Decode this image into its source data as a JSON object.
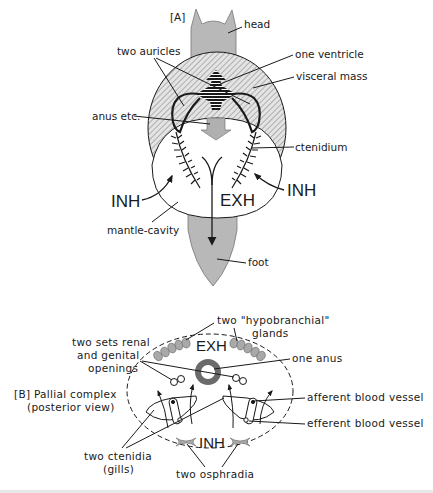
{
  "figure": {
    "panel_a": {
      "tag": "[A]",
      "labels": {
        "head": "head",
        "two_auricles": "two auricles",
        "one_ventricle": "one ventricle",
        "visceral_mass": "visceral mass",
        "anus": "anus etc.",
        "ctenidium": "ctenidium",
        "inh_left": "INH",
        "inh_right": "INH",
        "exh": "EXH",
        "mantle_cavity": "mantle-cavity",
        "foot": "foot"
      }
    },
    "panel_b": {
      "title_line1": "[B] Pallial complex",
      "title_line2": "(posterior view)",
      "labels": {
        "hypobranchial_line1": "two \"hypobranchial\"",
        "hypobranchial_line2": "glands",
        "renal_line1": "two sets renal",
        "renal_line2": "and genital",
        "renal_line3": "openings",
        "exh": "EXH",
        "one_anus": "one anus",
        "afferent": "afferent blood vessel",
        "efferent": "efferent blood vessel",
        "ctenidia_line1": "two ctenidia",
        "ctenidia_line2": "(gills)",
        "inh": "INH",
        "osphradia": "two osphradia"
      }
    },
    "colors": {
      "body_grey": "#b8b8b8",
      "hatch": "#8a8a8a",
      "ink": "#1a1a1a",
      "anus_ring": "#6a6a6a",
      "gland": "#a9a9a9"
    }
  }
}
